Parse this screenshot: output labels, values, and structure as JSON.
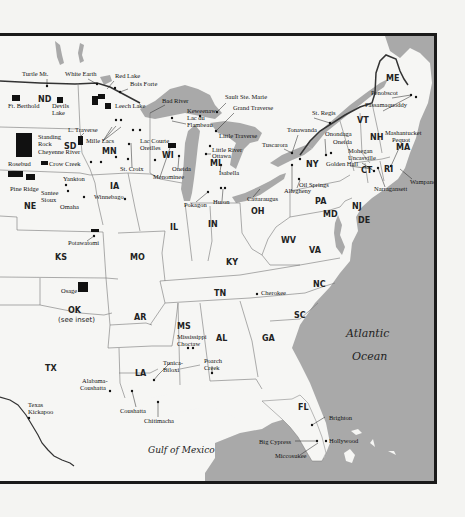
{
  "map": {
    "colors": {
      "land": "#f6f6f4",
      "water": "#a9a9a9",
      "borders": "#777777",
      "frame": "#1a1a1a",
      "reservation": "#111111",
      "intl_border": "#333333",
      "page": "#f4f4f2"
    },
    "water_labels": {
      "atlantic_line1": "Atlantic",
      "atlantic_line2": "Ocean",
      "gulf": "Gulf of Mexico"
    },
    "states": [
      {
        "abbr": "ND",
        "x": 38,
        "y": 99
      },
      {
        "abbr": "SD",
        "x": 64,
        "y": 146
      },
      {
        "abbr": "NE",
        "x": 24,
        "y": 206
      },
      {
        "abbr": "KS",
        "x": 55,
        "y": 257
      },
      {
        "abbr": "OK",
        "x": 68,
        "y": 310
      },
      {
        "abbr": "TX",
        "x": 45,
        "y": 368
      },
      {
        "abbr": "MN",
        "x": 102,
        "y": 151
      },
      {
        "abbr": "IA",
        "x": 110,
        "y": 186
      },
      {
        "abbr": "MO",
        "x": 130,
        "y": 257
      },
      {
        "abbr": "AR",
        "x": 134,
        "y": 317
      },
      {
        "abbr": "LA",
        "x": 135,
        "y": 373
      },
      {
        "abbr": "WI",
        "x": 162,
        "y": 155
      },
      {
        "abbr": "IL",
        "x": 170,
        "y": 227
      },
      {
        "abbr": "MI",
        "x": 210,
        "y": 163
      },
      {
        "abbr": "IN",
        "x": 208,
        "y": 224
      },
      {
        "abbr": "OH",
        "x": 251,
        "y": 211
      },
      {
        "abbr": "KY",
        "x": 226,
        "y": 262
      },
      {
        "abbr": "TN",
        "x": 214,
        "y": 293
      },
      {
        "abbr": "MS",
        "x": 177,
        "y": 326
      },
      {
        "abbr": "AL",
        "x": 216,
        "y": 338
      },
      {
        "abbr": "GA",
        "x": 262,
        "y": 338
      },
      {
        "abbr": "FL",
        "x": 298,
        "y": 407
      },
      {
        "abbr": "SC",
        "x": 294,
        "y": 315
      },
      {
        "abbr": "NC",
        "x": 313,
        "y": 284
      },
      {
        "abbr": "VA",
        "x": 309,
        "y": 250
      },
      {
        "abbr": "WV",
        "x": 281,
        "y": 240
      },
      {
        "abbr": "PA",
        "x": 315,
        "y": 201
      },
      {
        "abbr": "NY",
        "x": 306,
        "y": 164
      },
      {
        "abbr": "NJ",
        "x": 352,
        "y": 206
      },
      {
        "abbr": "MD",
        "x": 323,
        "y": 214
      },
      {
        "abbr": "DE",
        "x": 358,
        "y": 220
      },
      {
        "abbr": "VT",
        "x": 357,
        "y": 120
      },
      {
        "abbr": "NH",
        "x": 370,
        "y": 137
      },
      {
        "abbr": "ME",
        "x": 386,
        "y": 78
      },
      {
        "abbr": "MA",
        "x": 396,
        "y": 147
      },
      {
        "abbr": "CT",
        "x": 361,
        "y": 170
      },
      {
        "abbr": "RI",
        "x": 384,
        "y": 169
      }
    ],
    "state_sub_labels": [
      {
        "text": "(see inset)",
        "x": 58,
        "y": 319
      }
    ],
    "sites": [
      {
        "name": "Turtle Mt.",
        "x": 22,
        "y": 73
      },
      {
        "name": "White Earth",
        "x": 65,
        "y": 73
      },
      {
        "name": "Red Lake",
        "x": 115,
        "y": 75
      },
      {
        "name": "Bois Forte",
        "x": 130,
        "y": 83
      },
      {
        "name": "Ft. Berthold",
        "x": 8,
        "y": 105
      },
      {
        "name": "Devils",
        "x": 52,
        "y": 105
      },
      {
        "name": "Lake",
        "x": 52,
        "y": 112
      },
      {
        "name": "Leech Lake",
        "x": 115,
        "y": 105
      },
      {
        "name": "L. Traverse",
        "x": 68,
        "y": 129
      },
      {
        "name": "Standing",
        "x": 38,
        "y": 136
      },
      {
        "name": "Rock",
        "x": 38,
        "y": 143
      },
      {
        "name": "Mille Lacs",
        "x": 86,
        "y": 140
      },
      {
        "name": "Cheyenne River",
        "x": 38,
        "y": 151
      },
      {
        "name": "Crow Creek",
        "x": 49,
        "y": 163
      },
      {
        "name": "Rosebud",
        "x": 8,
        "y": 163
      },
      {
        "name": "Yankton",
        "x": 63,
        "y": 178
      },
      {
        "name": "Pine Ridge",
        "x": 10,
        "y": 188
      },
      {
        "name": "Santee",
        "x": 41,
        "y": 192
      },
      {
        "name": "Sioux",
        "x": 41,
        "y": 199
      },
      {
        "name": "Omaha",
        "x": 60,
        "y": 206
      },
      {
        "name": "Winnebago",
        "x": 94,
        "y": 196
      },
      {
        "name": "Lac Courte",
        "x": 140,
        "y": 140
      },
      {
        "name": "Oreilles",
        "x": 140,
        "y": 147
      },
      {
        "name": "St. Croix",
        "x": 120,
        "y": 168
      },
      {
        "name": "Bad River",
        "x": 162,
        "y": 100
      },
      {
        "name": "Keweenaw",
        "x": 187,
        "y": 110
      },
      {
        "name": "Lac du",
        "x": 187,
        "y": 117
      },
      {
        "name": "Flambeau",
        "x": 187,
        "y": 124
      },
      {
        "name": "Sault Ste. Marie",
        "x": 225,
        "y": 96
      },
      {
        "name": "Grand Traverse",
        "x": 233,
        "y": 107
      },
      {
        "name": "Little Traverse",
        "x": 219,
        "y": 135
      },
      {
        "name": "Little River",
        "x": 212,
        "y": 149
      },
      {
        "name": "Ottawa",
        "x": 212,
        "y": 155
      },
      {
        "name": "Isabella",
        "x": 219,
        "y": 172
      },
      {
        "name": "Oneida",
        "x": 172,
        "y": 168
      },
      {
        "name": "Menominee",
        "x": 153,
        "y": 176
      },
      {
        "name": "Pokagon",
        "x": 184,
        "y": 204
      },
      {
        "name": "Huron",
        "x": 213,
        "y": 201
      },
      {
        "name": "Cattaraugus",
        "x": 247,
        "y": 198
      },
      {
        "name": "Tonawanda",
        "x": 287,
        "y": 129
      },
      {
        "name": "Tuscarora",
        "x": 262,
        "y": 144
      },
      {
        "name": "St. Regis",
        "x": 312,
        "y": 112
      },
      {
        "name": "Onondaga",
        "x": 325,
        "y": 133
      },
      {
        "name": "Oneida",
        "x": 333,
        "y": 141
      },
      {
        "name": "Oil Springs",
        "x": 299,
        "y": 184
      },
      {
        "name": "Allegheny",
        "x": 284,
        "y": 190
      },
      {
        "name": "Mohegan",
        "x": 348,
        "y": 150
      },
      {
        "name": "Uncasville",
        "x": 348,
        "y": 157
      },
      {
        "name": "Golden Hall",
        "x": 326,
        "y": 163
      },
      {
        "name": "Penobscot",
        "x": 371,
        "y": 92
      },
      {
        "name": "Passamaquoddy",
        "x": 365,
        "y": 104
      },
      {
        "name": "Mashantucket",
        "x": 385,
        "y": 132
      },
      {
        "name": "Pequot",
        "x": 392,
        "y": 139
      },
      {
        "name": "Wampanoag",
        "x": 410,
        "y": 181
      },
      {
        "name": "Narragansett",
        "x": 374,
        "y": 188
      },
      {
        "name": "Potawatomi",
        "x": 68,
        "y": 242
      },
      {
        "name": "Osage",
        "x": 61,
        "y": 290
      },
      {
        "name": "Cherokee",
        "x": 261,
        "y": 292
      },
      {
        "name": "Mississippi",
        "x": 177,
        "y": 336
      },
      {
        "name": "Choctaw",
        "x": 177,
        "y": 343
      },
      {
        "name": "Tunica-",
        "x": 163,
        "y": 362
      },
      {
        "name": "Biloxi",
        "x": 163,
        "y": 369
      },
      {
        "name": "Poarch",
        "x": 204,
        "y": 360
      },
      {
        "name": "Creek",
        "x": 204,
        "y": 367
      },
      {
        "name": "Alabama-",
        "x": 82,
        "y": 380
      },
      {
        "name": "Coushatta",
        "x": 80,
        "y": 387
      },
      {
        "name": "Coushatta",
        "x": 120,
        "y": 410
      },
      {
        "name": "Chitimacha",
        "x": 144,
        "y": 420
      },
      {
        "name": "Texas",
        "x": 28,
        "y": 404
      },
      {
        "name": "Kickapoo",
        "x": 28,
        "y": 411
      },
      {
        "name": "Brighton",
        "x": 329,
        "y": 417
      },
      {
        "name": "Hollywood",
        "x": 329,
        "y": 440
      },
      {
        "name": "Big Cypress",
        "x": 259,
        "y": 441
      },
      {
        "name": "Miccosukee",
        "x": 275,
        "y": 455
      }
    ]
  }
}
